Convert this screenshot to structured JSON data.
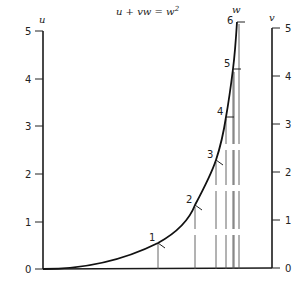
{
  "title_parts": {
    "lhs": "u + vw = w",
    "sup": "2"
  },
  "axes": {
    "u": {
      "label": "u",
      "ticks": [
        {
          "value": "0",
          "y": 269
        },
        {
          "value": "1",
          "y": 222
        },
        {
          "value": "2",
          "y": 174
        },
        {
          "value": "3",
          "y": 126
        },
        {
          "value": "4",
          "y": 79
        },
        {
          "value": "5",
          "y": 31
        }
      ]
    },
    "v": {
      "label": "v",
      "ticks": [
        {
          "value": "0",
          "y": 268
        },
        {
          "value": "1",
          "y": 220
        },
        {
          "value": "2",
          "y": 172
        },
        {
          "value": "3",
          "y": 124
        },
        {
          "value": "4",
          "y": 76
        },
        {
          "value": "5",
          "y": 28
        }
      ]
    },
    "w": {
      "label": "w",
      "points": [
        {
          "value": "1",
          "x": 158,
          "y": 243
        },
        {
          "value": "2",
          "x": 195,
          "y": 205
        },
        {
          "value": "3",
          "x": 216,
          "y": 160
        },
        {
          "value": "4",
          "x": 226,
          "y": 117
        },
        {
          "value": "5",
          "x": 233,
          "y": 69
        },
        {
          "value": "6",
          "x": 237,
          "y": 22
        }
      ]
    }
  },
  "colors": {
    "ink": "#1a1a1a",
    "background": "#ffffff",
    "guide": "#555555"
  }
}
